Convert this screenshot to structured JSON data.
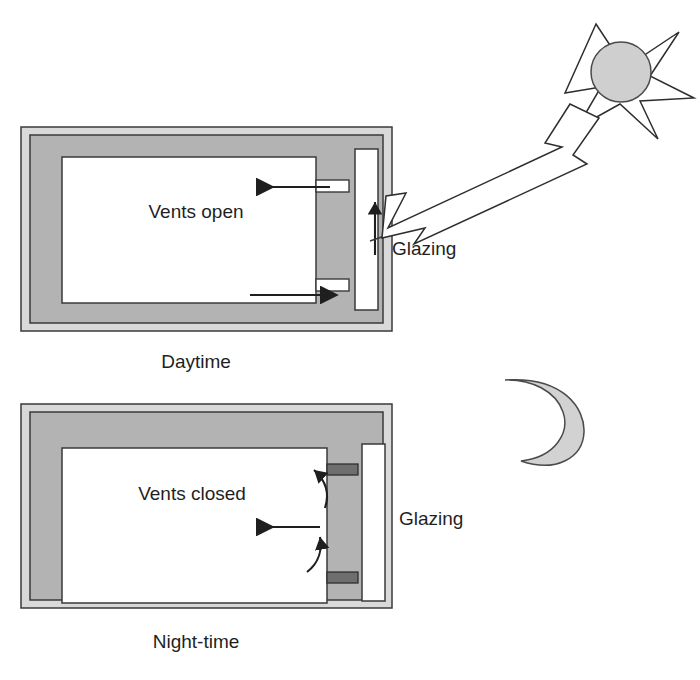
{
  "figure": {
    "panels": [
      {
        "id": "daytime",
        "caption": "Daytime",
        "vents_label": "Vents open",
        "glazing_label": "Glazing",
        "vent_state": "open",
        "airflow": [
          {
            "name": "upper-inflow",
            "direction": "left"
          },
          {
            "name": "lower-outflow",
            "direction": "right"
          }
        ],
        "celestial": "sun"
      },
      {
        "id": "night-time",
        "caption": "Night-time",
        "vents_label": "Vents closed",
        "glazing_label": "Glazing",
        "vent_state": "closed",
        "airflow": [
          {
            "name": "upper-curved",
            "direction": "up"
          },
          {
            "name": "middle-straight",
            "direction": "left"
          },
          {
            "name": "lower-curved",
            "direction": "up"
          }
        ],
        "celestial": "moon"
      }
    ],
    "icons": {
      "sun": "sun-icon",
      "moon": "crescent-moon-icon",
      "sun_ray": "solar-ray-arrow-icon"
    },
    "colors": {
      "outer_band": "#d9d9d9",
      "inner_wall": "#b3b3b3",
      "room_fill": "#ffffff",
      "glazing_fill": "#ffffff",
      "vent_closed": "#6e6e6e",
      "outline": "#3a3a3a",
      "sun_disc": "#cfcfcf",
      "moon_fill": "#d2d2d2"
    }
  }
}
